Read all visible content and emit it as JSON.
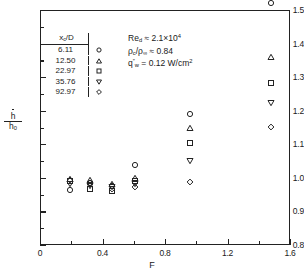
{
  "chart_data": {
    "type": "scatter",
    "title": "",
    "xlabel": "F",
    "ylabel": "h/h0",
    "ylabel_numerator": "h",
    "ylabel_denominator": "h",
    "ylabel_denominator_sub": "0",
    "xlim": [
      0,
      1.6
    ],
    "ylim": [
      0.8,
      1.5
    ],
    "xticks": [
      0,
      0.4,
      0.8,
      1.2,
      1.6
    ],
    "xtick_labels": [
      "0",
      "0.4",
      "0.8",
      "1.2",
      "1.6"
    ],
    "xminorticks": [
      0.2,
      0.6,
      1.0,
      1.4
    ],
    "yticks": [
      0.8,
      0.9,
      1.0,
      1.1,
      1.2,
      1.3,
      1.4,
      1.5
    ],
    "ytick_labels": [
      "0.8",
      "0.9",
      "1.0",
      "1.1",
      "1.2",
      "1.3",
      "1.4",
      "1.5"
    ],
    "grid": false,
    "legend_position": "upper-left-inside",
    "legend_title": "xc/D",
    "series": [
      {
        "name": "6.11",
        "marker": "circle",
        "x": [
          0.19,
          0.32,
          0.46,
          0.61,
          0.96,
          1.48
        ],
        "y": [
          0.965,
          0.985,
          0.975,
          1.038,
          1.19,
          1.52
        ]
      },
      {
        "name": "12.50",
        "marker": "triangle-up",
        "x": [
          0.19,
          0.32,
          0.46,
          0.61,
          0.96,
          1.48
        ],
        "y": [
          0.998,
          0.993,
          0.982,
          1.0,
          1.15,
          1.36
        ]
      },
      {
        "name": "22.97",
        "marker": "square",
        "x": [
          0.19,
          0.32,
          0.46,
          0.61,
          0.96,
          1.48
        ],
        "y": [
          0.99,
          0.968,
          0.962,
          0.99,
          1.105,
          1.283
        ]
      },
      {
        "name": "35.76",
        "marker": "triangle-down",
        "x": [
          0.19,
          0.32,
          0.46,
          0.61,
          0.96,
          1.48
        ],
        "y": [
          0.982,
          0.977,
          0.972,
          0.982,
          1.05,
          1.222
        ]
      },
      {
        "name": "92.97",
        "marker": "diamond",
        "x": [
          0.19,
          0.32,
          0.46,
          0.61,
          0.96,
          1.48
        ],
        "y": [
          0.993,
          0.985,
          0.968,
          0.972,
          0.988,
          1.152
        ]
      }
    ]
  },
  "legend": {
    "header_label": "x",
    "header_sub": "c",
    "header_tail": "/D",
    "rows": [
      {
        "value": "6.11",
        "marker": "circle"
      },
      {
        "value": "12.50",
        "marker": "triangle-up"
      },
      {
        "value": "22.97",
        "marker": "square"
      },
      {
        "value": "35.76",
        "marker": "triangle-down"
      },
      {
        "value": "92.97",
        "marker": "diamond"
      }
    ]
  },
  "annotations": {
    "line1": {
      "symbol": "Re",
      "sub": "d",
      "rel": "≈",
      "value": "2.1",
      "times": "×",
      "base": "10",
      "exp": "4",
      "full": "Re_d ≈ 2.1×10⁴"
    },
    "line2": {
      "num_sym": "ρ",
      "num_sub": "c",
      "den_sym": "ρ",
      "den_sub": "∞",
      "rel": "≈",
      "value": "0.84",
      "full": "ρ_c/ρ_∞ ≈ 0.84"
    },
    "line3": {
      "symbol": "q",
      "prime": "″",
      "sub": "w",
      "rel": "=",
      "value": "0.12",
      "unit": "W/cm",
      "unit_exp": "2",
      "full": "q″_w = 0.12 W/cm²"
    }
  },
  "style": {
    "axis_color": "#222222",
    "marker_color": "#222222",
    "background": "#ffffff"
  }
}
